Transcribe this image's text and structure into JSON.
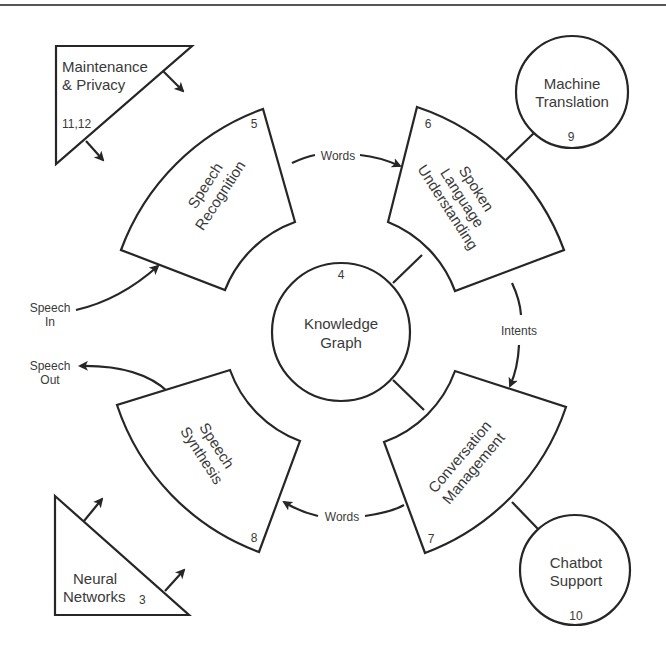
{
  "diagram": {
    "center_node": {
      "label_line1": "Knowledge",
      "label_line2": "Graph",
      "number": "4"
    },
    "segments": [
      {
        "id": "speech-recognition",
        "label_line1": "Speech",
        "label_line2": "Recognition",
        "number": "5"
      },
      {
        "id": "spoken-language-understanding",
        "label_line1": "Spoken",
        "label_line2": "Language",
        "label_line3": "Understanding",
        "number": "6"
      },
      {
        "id": "conversation-management",
        "label_line1": "Conversation",
        "label_line2": "Management",
        "number": "7"
      },
      {
        "id": "speech-synthesis",
        "label_line1": "Speech",
        "label_line2": "Synthesis",
        "number": "8"
      }
    ],
    "satellites": [
      {
        "id": "machine-translation",
        "label_line1": "Machine",
        "label_line2": "Translation",
        "number": "9"
      },
      {
        "id": "chatbot-support",
        "label_line1": "Chatbot",
        "label_line2": "Support",
        "number": "10"
      }
    ],
    "triangles": [
      {
        "id": "maintenance-privacy",
        "label_line1": "Maintenance",
        "label_line2": "& Privacy",
        "number": "11,12"
      },
      {
        "id": "neural-networks",
        "label_line1": "Neural",
        "label_line2": "Networks",
        "number": "3"
      }
    ],
    "flows": {
      "words_top": "Words",
      "intents": "Intents",
      "words_bottom": "Words",
      "speech_in_line1": "Speech",
      "speech_in_line2": "In",
      "speech_out_line1": "Speech",
      "speech_out_line2": "Out"
    },
    "colors": {
      "stroke": "#262626",
      "text": "#3a3a3a",
      "background": "#ffffff"
    }
  }
}
